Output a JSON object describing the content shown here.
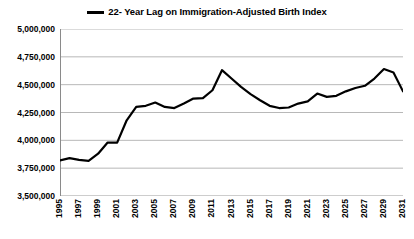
{
  "legend": {
    "label": "22- Year Lag on Immigration-Adjusted Birth Index",
    "marker": "line-swatch",
    "color": "#000000"
  },
  "axis": {
    "y_tick_labels": [
      "5,000,000",
      "4,750,000",
      "4,500,000",
      "4,250,000",
      "4,000,000",
      "3,750,000",
      "3,500,000"
    ],
    "x_tick_labels": [
      "1995",
      "1997",
      "1999",
      "2001",
      "2003",
      "2005",
      "2007",
      "2009",
      "2011",
      "2013",
      "2015",
      "2017",
      "2019",
      "2021",
      "2023",
      "2025",
      "2027",
      "2029",
      "2031"
    ]
  },
  "chart_data": {
    "type": "line",
    "title": "",
    "subtitle": "",
    "xlabel": "",
    "ylabel": "",
    "xlim": [
      1995,
      2031
    ],
    "ylim": [
      3500000,
      5000000
    ],
    "ytick_step": 250000,
    "grid": true,
    "legend_position": "top-center",
    "line_color": "#000000",
    "line_width": 2.2,
    "categories": [
      1995,
      1996,
      1997,
      1998,
      1999,
      2000,
      2001,
      2002,
      2003,
      2004,
      2005,
      2006,
      2007,
      2008,
      2009,
      2010,
      2011,
      2012,
      2013,
      2014,
      2015,
      2016,
      2017,
      2018,
      2019,
      2020,
      2021,
      2022,
      2023,
      2024,
      2025,
      2026,
      2027,
      2028,
      2029,
      2030,
      2031
    ],
    "series": [
      {
        "name": "22- Year Lag on Immigration-Adjusted Birth Index",
        "values": [
          3820000,
          3840000,
          3825000,
          3815000,
          3880000,
          3980000,
          3980000,
          4180000,
          4300000,
          4310000,
          4340000,
          4300000,
          4290000,
          4330000,
          4375000,
          4380000,
          4450000,
          4630000,
          4555000,
          4480000,
          4415000,
          4360000,
          4310000,
          4290000,
          4295000,
          4330000,
          4350000,
          4420000,
          4390000,
          4400000,
          4440000,
          4470000,
          4490000,
          4555000,
          4640000,
          4610000,
          4440000
        ]
      }
    ],
    "annotations": []
  }
}
